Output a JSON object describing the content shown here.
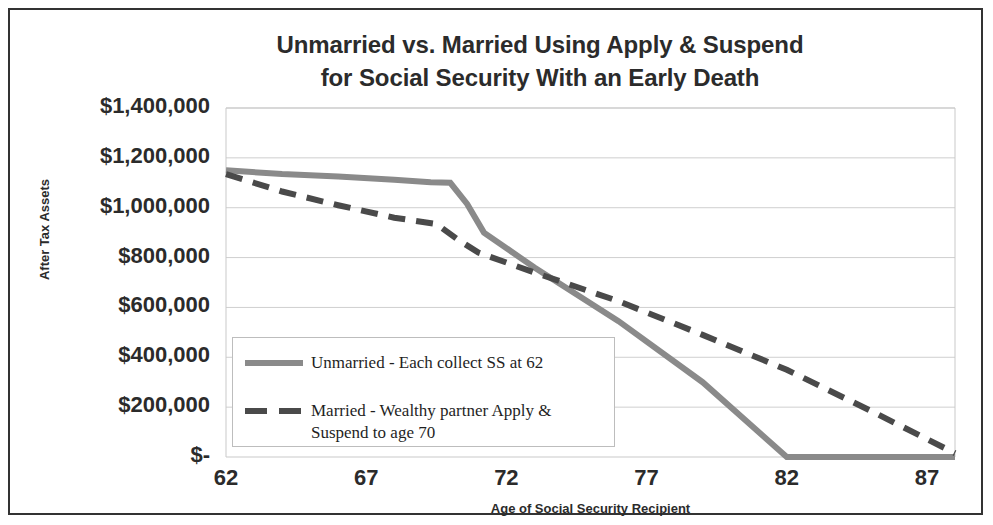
{
  "chart_data": {
    "type": "line",
    "title": "Unmarried vs. Married Using Apply & Suspend for Social Security With an Early Death",
    "title_lines": [
      "Unmarried vs. Married Using Apply & Suspend",
      "for Social Security With an Early Death"
    ],
    "xlabel": "Age of Social Security Recipient",
    "ylabel": "After Tax Assets",
    "xlim": [
      62,
      88
    ],
    "ylim": [
      0,
      1400000
    ],
    "xticks": [
      62,
      67,
      72,
      77,
      82,
      87
    ],
    "xtick_labels": [
      "62",
      "67",
      "72",
      "77",
      "82",
      "87"
    ],
    "yticks": [
      0,
      200000,
      400000,
      600000,
      800000,
      1000000,
      1200000,
      1400000
    ],
    "ytick_labels": [
      "$-",
      "$200,000",
      "$400,000",
      "$600,000",
      "$800,000",
      "$1,000,000",
      "$1,200,000",
      "$1,400,000"
    ],
    "grid": true,
    "grid_color": "#c9c9c9",
    "legend_position": "inside-lower-left",
    "plot_background": "#ffffff",
    "series": [
      {
        "name": "Unmarried - Each collect SS at 62",
        "color": "#8a8a8a",
        "style": "solid",
        "width": 6,
        "x": [
          62,
          64,
          66,
          68,
          69.3,
          70.0,
          70.6,
          71.2,
          73.0,
          76.0,
          79.0,
          82.0,
          85.0,
          88.0
        ],
        "values": [
          1150000,
          1135000,
          1125000,
          1112000,
          1102000,
          1100000,
          1015000,
          900000,
          760000,
          545000,
          300000,
          0,
          0,
          0
        ]
      },
      {
        "name": "Married - Wealthy partner Apply & Suspend to age 70",
        "color": "#4a4a4a",
        "style": "dashed",
        "width": 6,
        "x": [
          62,
          64,
          66,
          68,
          69.5,
          70.3,
          71.0,
          73.0,
          76.0,
          79.0,
          82.0,
          85.0,
          88.0
        ],
        "values": [
          1135000,
          1065000,
          1010000,
          960000,
          935000,
          870000,
          820000,
          740000,
          625000,
          490000,
          350000,
          185000,
          15000
        ]
      }
    ],
    "annotations": []
  },
  "legend": {
    "items": [
      {
        "label": "Unmarried - Each collect SS at 62",
        "color": "#8a8a8a",
        "style": "solid"
      },
      {
        "label": "Married - Wealthy partner Apply &\nSuspend to age 70",
        "color": "#4a4a4a",
        "style": "dashed"
      }
    ]
  }
}
